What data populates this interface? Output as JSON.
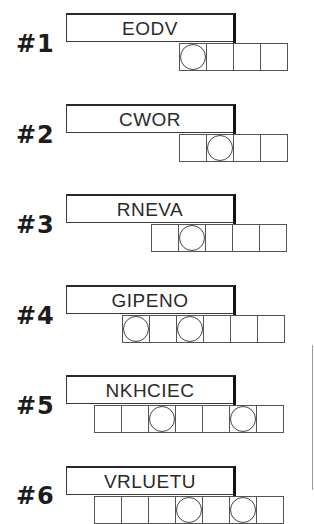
{
  "puzzles": [
    {
      "label": "#1",
      "scrambled": "EODV",
      "answer_length": 4,
      "circled_positions": [
        1
      ],
      "layout": {
        "box_top": 13,
        "cells_left": 179
      }
    },
    {
      "label": "#2",
      "scrambled": "CWOR",
      "answer_length": 4,
      "circled_positions": [
        2
      ],
      "layout": {
        "box_top": 104,
        "cells_left": 179
      }
    },
    {
      "label": "#3",
      "scrambled": "RNEVA",
      "answer_length": 5,
      "circled_positions": [
        2
      ],
      "layout": {
        "box_top": 194,
        "cells_left": 151
      }
    },
    {
      "label": "#4",
      "scrambled": "GIPENO",
      "answer_length": 6,
      "circled_positions": [
        1,
        3
      ],
      "layout": {
        "box_top": 285,
        "cells_left": 122
      }
    },
    {
      "label": "#5",
      "scrambled": "NKHCIEC",
      "answer_length": 7,
      "circled_positions": [
        3,
        6
      ],
      "layout": {
        "box_top": 375,
        "cells_left": 94
      }
    },
    {
      "label": "#6",
      "scrambled": "VRLUETU",
      "answer_length": 7,
      "circled_positions": [
        4,
        6
      ],
      "layout": {
        "box_top": 466,
        "cells_left": 94
      }
    }
  ],
  "colors": {
    "background": "#ffffff",
    "ink": "#1a1a1a",
    "cell_border": "#555555"
  }
}
